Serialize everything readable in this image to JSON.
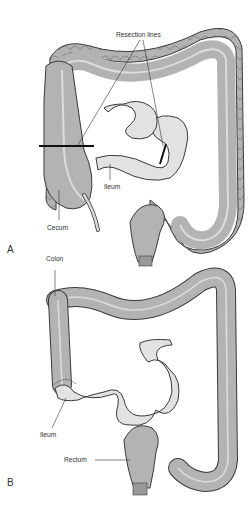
{
  "figure": {
    "panel_a": {
      "letter": "A",
      "labels": {
        "resection_lines": "Resection lines",
        "ileum": "Ileum",
        "cecum": "Cecum"
      }
    },
    "panel_b": {
      "letter": "B",
      "labels": {
        "colon": "Colon",
        "ileum": "Ileum",
        "rectum": "Rectum"
      }
    }
  },
  "colors": {
    "colon_fill": "#b3b3b3",
    "ileum_fill": "#e2e2e2",
    "outline": "#3a3a3a",
    "resection_line": "#111111"
  }
}
